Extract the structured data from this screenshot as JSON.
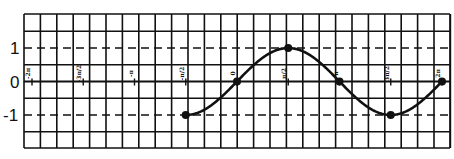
{
  "chart_data": {
    "type": "line",
    "title": "",
    "xlabel": "",
    "ylabel": "",
    "function": "y = sin x",
    "xlim": [
      -2.5,
      2.12
    ],
    "ylim": [
      -2,
      2
    ],
    "grid": true,
    "x_ticks": [
      {
        "value": -2.0,
        "label": "-2π"
      },
      {
        "value": -1.5,
        "label": "-3π/2"
      },
      {
        "value": -1.0,
        "label": "-π"
      },
      {
        "value": -0.5,
        "label": "-π/2"
      },
      {
        "value": 0.0,
        "label": "0"
      },
      {
        "value": 0.5,
        "label": "π/2"
      },
      {
        "value": 1.0,
        "label": "π"
      },
      {
        "value": 1.5,
        "label": "3π/2"
      },
      {
        "value": 2.0,
        "label": "2π"
      }
    ],
    "x_unit": "π",
    "y_ticks": [
      {
        "value": 1,
        "label": "1"
      },
      {
        "value": 0,
        "label": "0"
      },
      {
        "value": -1,
        "label": "-1"
      }
    ],
    "dashed_lines": [
      1,
      -1
    ],
    "series": [
      {
        "name": "sin x",
        "domain": [
          "-π/2",
          "2π"
        ],
        "points": [
          {
            "x": "-π/2",
            "y": -1
          },
          {
            "x": "0",
            "y": 0
          },
          {
            "x": "π/2",
            "y": 1
          },
          {
            "x": "π",
            "y": 0
          },
          {
            "x": "3π/2",
            "y": -1
          },
          {
            "x": "2π",
            "y": 0
          }
        ]
      }
    ],
    "legend": null
  }
}
